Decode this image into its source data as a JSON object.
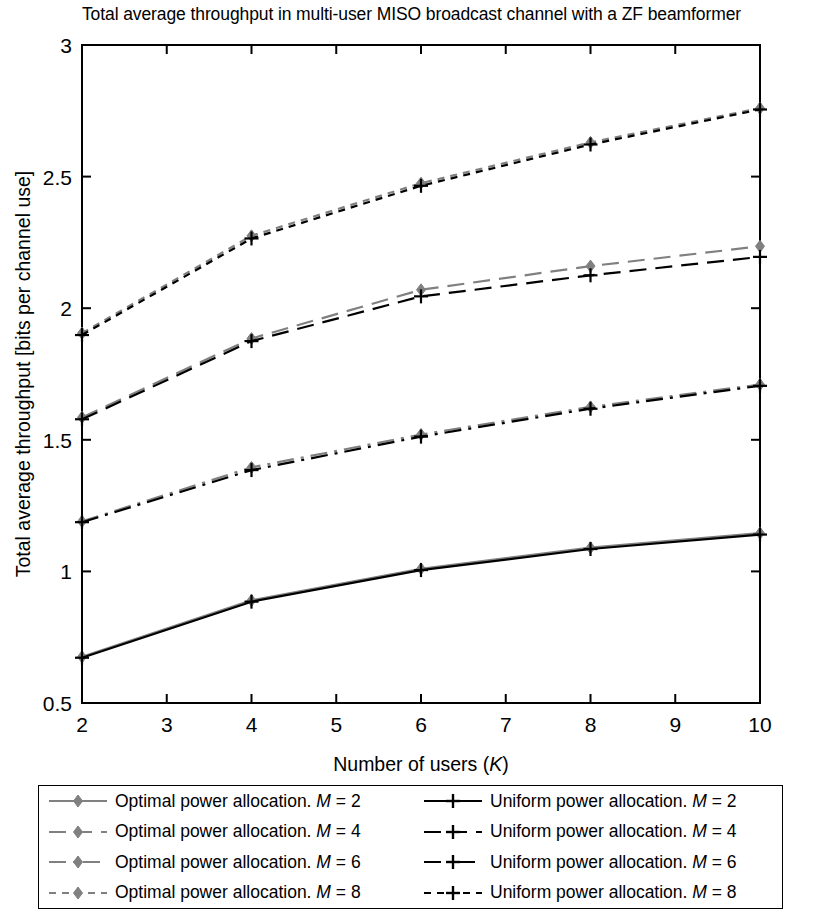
{
  "chart_data": {
    "type": "line",
    "title": "Total average throughput in multi-user MISO broadcast channel with a ZF beamformer",
    "xlabel": "Number of users (K)",
    "ylabel": "Total average throughput [bits per channel use]",
    "x": [
      2,
      4,
      6,
      8,
      10
    ],
    "xlim": [
      2,
      10
    ],
    "ylim": [
      0.5,
      3
    ],
    "xticks": [
      2,
      3,
      4,
      5,
      6,
      7,
      8,
      9,
      10
    ],
    "xtick_labels": [
      "2",
      "3",
      "4",
      "5",
      "6",
      "7",
      "8",
      "9",
      "10"
    ],
    "yticks": [
      0.5,
      1,
      1.5,
      2,
      2.5,
      3
    ],
    "ytick_labels": [
      "0.5",
      "1",
      "1.5",
      "2",
      "2.5",
      "3"
    ],
    "grid": false,
    "legend_position": "below-axes",
    "series": [
      {
        "name": "Optimal power allocation. M = 2",
        "label_prefix": "Optimal power allocation.",
        "label_var": "M",
        "label_value": "2",
        "values": [
          0.675,
          0.89,
          1.01,
          1.09,
          1.145
        ],
        "color": "#808080",
        "dash": "none",
        "marker": "diamond"
      },
      {
        "name": "Optimal power allocation. M = 4",
        "label_prefix": "Optimal power allocation.",
        "label_var": "M",
        "label_value": "4",
        "values": [
          1.585,
          1.885,
          2.07,
          2.16,
          2.235
        ],
        "color": "#808080",
        "dash": "dashed",
        "marker": "diamond"
      },
      {
        "name": "Optimal power allocation. M = 6",
        "label_prefix": "Optimal power allocation.",
        "label_var": "M",
        "label_value": "6",
        "values": [
          1.19,
          1.395,
          1.52,
          1.625,
          1.71
        ],
        "color": "#808080",
        "dash": "dashdot",
        "marker": "diamond"
      },
      {
        "name": "Optimal power allocation. M = 8",
        "label_prefix": "Optimal power allocation.",
        "label_var": "M",
        "label_value": "8",
        "values": [
          1.905,
          2.275,
          2.475,
          2.63,
          2.76
        ],
        "color": "#808080",
        "dash": "dotted",
        "marker": "diamond"
      },
      {
        "name": "Uniform power allocation. M = 2",
        "label_prefix": "Uniform power allocation.",
        "label_var": "M",
        "label_value": "2",
        "values": [
          0.672,
          0.885,
          1.005,
          1.085,
          1.14
        ],
        "color": "#000000",
        "dash": "none",
        "marker": "plus"
      },
      {
        "name": "Uniform power allocation. M = 4",
        "label_prefix": "Uniform power allocation.",
        "label_var": "M",
        "label_value": "4",
        "values": [
          1.578,
          1.875,
          2.045,
          2.125,
          2.195
        ],
        "color": "#000000",
        "dash": "dashed",
        "marker": "plus"
      },
      {
        "name": "Uniform power allocation. M = 6",
        "label_prefix": "Uniform power allocation.",
        "label_var": "M",
        "label_value": "6",
        "values": [
          1.187,
          1.385,
          1.512,
          1.618,
          1.705
        ],
        "color": "#000000",
        "dash": "dashdot",
        "marker": "plus"
      },
      {
        "name": "Uniform power allocation. M = 8",
        "label_prefix": "Uniform power allocation.",
        "label_var": "M",
        "label_value": "8",
        "values": [
          1.898,
          2.265,
          2.465,
          2.622,
          2.755
        ],
        "color": "#000000",
        "dash": "dotted",
        "marker": "plus"
      }
    ]
  }
}
